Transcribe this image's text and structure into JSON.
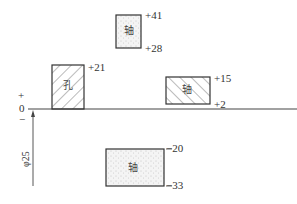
{
  "diagram": {
    "type": "tolerance-zone-diagram",
    "zero_line_label": "0",
    "plus_sign": "+",
    "minus_sign": "−",
    "basic_size_label": "φ25",
    "zones": [
      {
        "id": "hole",
        "label": "孔",
        "upper": "+21",
        "lower": "0",
        "pattern": "hatch-right"
      },
      {
        "id": "shaft-1",
        "label": "轴",
        "upper": "+41",
        "lower": "+28",
        "pattern": "dots"
      },
      {
        "id": "shaft-2",
        "label": "轴",
        "upper": "+15",
        "lower": "+2",
        "pattern": "hatch-left"
      },
      {
        "id": "shaft-3",
        "label": "轴",
        "upper": "−20",
        "lower": "−33",
        "pattern": "dots"
      }
    ]
  }
}
